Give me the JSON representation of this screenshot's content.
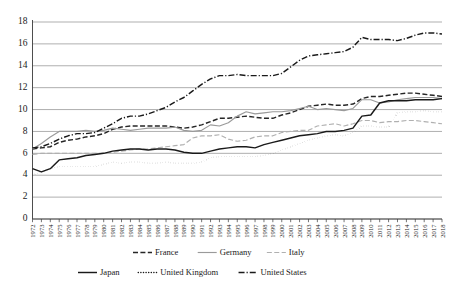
{
  "chart_data": {
    "type": "line",
    "title": "",
    "xlabel": "",
    "ylabel": "",
    "ylim": [
      0,
      18
    ],
    "ytick_step": 2,
    "yticks": [
      "0",
      "2",
      "4",
      "6",
      "8",
      "10",
      "12",
      "14",
      "16",
      "18"
    ],
    "grid": true,
    "legend_position": "bottom",
    "x": [
      1972,
      1973,
      1974,
      1975,
      1976,
      1977,
      1978,
      1979,
      1980,
      1981,
      1982,
      1983,
      1984,
      1985,
      1986,
      1987,
      1988,
      1989,
      1990,
      1991,
      1992,
      1993,
      1994,
      1995,
      1996,
      1997,
      1998,
      1999,
      2000,
      2001,
      2002,
      2003,
      2004,
      2005,
      2006,
      2007,
      2008,
      2009,
      2010,
      2011,
      2012,
      2013,
      2014,
      2015,
      2016,
      2017,
      2018
    ],
    "categories": [
      "1972",
      "1973",
      "1974",
      "1975",
      "1976",
      "1977",
      "1978",
      "1979",
      "1980",
      "1981",
      "1982",
      "1983",
      "1984",
      "1985",
      "1986",
      "1987",
      "1988",
      "1989",
      "1990",
      "1991",
      "1992",
      "1993",
      "1994",
      "1995",
      "1996",
      "1997",
      "1998",
      "1999",
      "2000",
      "2001",
      "2002",
      "2003",
      "2004",
      "2005",
      "2006",
      "2007",
      "2008",
      "2009",
      "2010",
      "2011",
      "2012",
      "2013",
      "2014",
      "2015",
      "2016",
      "2017",
      "2018"
    ],
    "series": [
      {
        "name": "France",
        "color": "#262626",
        "dash": "dashed",
        "values": [
          6.4,
          6.5,
          6.6,
          7.0,
          7.2,
          7.3,
          7.5,
          7.6,
          7.8,
          8.2,
          8.4,
          8.5,
          8.5,
          8.5,
          8.5,
          8.5,
          8.4,
          8.3,
          8.4,
          8.6,
          8.9,
          9.2,
          9.2,
          9.3,
          9.4,
          9.3,
          9.2,
          9.2,
          9.5,
          9.7,
          10.0,
          10.3,
          10.4,
          10.5,
          10.4,
          10.4,
          10.5,
          11.0,
          11.2,
          11.2,
          11.3,
          11.4,
          11.5,
          11.5,
          11.4,
          11.3,
          11.2
        ]
      },
      {
        "name": "Germany",
        "color": "#9a9a9a",
        "dash": "solid",
        "values": [
          6.4,
          6.9,
          7.5,
          8.0,
          8.0,
          8.0,
          8.1,
          8.0,
          8.1,
          8.3,
          8.2,
          8.1,
          8.2,
          8.3,
          8.3,
          8.3,
          8.4,
          8.1,
          8.0,
          8.1,
          8.6,
          8.5,
          8.8,
          9.4,
          9.8,
          9.6,
          9.7,
          9.8,
          9.8,
          9.9,
          10.1,
          10.3,
          10.0,
          10.1,
          10.0,
          9.9,
          10.1,
          10.9,
          10.9,
          10.6,
          10.7,
          10.9,
          11.0,
          11.1,
          11.1,
          11.1,
          11.0
        ]
      },
      {
        "name": "Italy",
        "color": "#b0b0b0",
        "dash": "dashed",
        "values": [
          5.9,
          6.0,
          6.0,
          6.0,
          6.0,
          6.0,
          6.0,
          6.0,
          6.0,
          6.1,
          6.2,
          6.3,
          6.4,
          6.4,
          6.5,
          6.6,
          6.7,
          6.8,
          7.4,
          7.6,
          7.6,
          7.7,
          7.3,
          7.1,
          7.2,
          7.5,
          7.6,
          7.6,
          7.9,
          8.0,
          8.1,
          8.1,
          8.5,
          8.6,
          8.7,
          8.5,
          8.7,
          9.0,
          9.0,
          8.8,
          8.9,
          8.9,
          9.0,
          9.0,
          8.9,
          8.8,
          8.7
        ]
      },
      {
        "name": "Japan",
        "color": "#1a1a1a",
        "dash": "solid",
        "values": [
          4.6,
          4.3,
          4.6,
          5.4,
          5.5,
          5.6,
          5.8,
          5.9,
          6.0,
          6.2,
          6.3,
          6.4,
          6.4,
          6.3,
          6.4,
          6.4,
          6.3,
          6.1,
          6.0,
          6.0,
          6.2,
          6.4,
          6.5,
          6.6,
          6.6,
          6.5,
          6.8,
          7.0,
          7.2,
          7.4,
          7.6,
          7.7,
          7.8,
          8.0,
          8.0,
          8.1,
          8.3,
          9.4,
          9.5,
          10.6,
          10.8,
          10.8,
          10.8,
          10.9,
          10.9,
          10.9,
          11.0
        ]
      },
      {
        "name": "United Kingdom",
        "color": "#1a1a1a",
        "dash": "dotted",
        "values": [
          4.0,
          4.3,
          4.6,
          4.8,
          4.8,
          4.8,
          4.8,
          4.8,
          5.0,
          5.2,
          5.1,
          5.2,
          5.2,
          5.1,
          5.1,
          5.2,
          5.1,
          5.1,
          5.1,
          5.2,
          5.6,
          5.7,
          5.7,
          5.7,
          5.7,
          5.7,
          5.8,
          6.0,
          6.3,
          6.6,
          6.9,
          7.2,
          7.4,
          7.6,
          7.7,
          7.6,
          7.9,
          8.5,
          8.5,
          8.4,
          8.4,
          9.7,
          9.8,
          9.8,
          9.9,
          9.8,
          9.8
        ]
      },
      {
        "name": "United States",
        "color": "#1a1a1a",
        "dash": "dashdot",
        "values": [
          6.5,
          6.6,
          6.9,
          7.3,
          7.6,
          7.8,
          7.8,
          7.9,
          8.3,
          8.7,
          9.2,
          9.4,
          9.4,
          9.6,
          9.9,
          10.2,
          10.7,
          11.1,
          11.7,
          12.3,
          12.8,
          13.1,
          13.1,
          13.2,
          13.1,
          13.1,
          13.1,
          13.1,
          13.3,
          13.9,
          14.5,
          14.9,
          15.0,
          15.1,
          15.2,
          15.3,
          15.7,
          16.6,
          16.4,
          16.4,
          16.4,
          16.3,
          16.5,
          16.8,
          17.0,
          17.0,
          16.9
        ]
      }
    ],
    "legend_rows": [
      [
        {
          "label": "France",
          "dash": "dashed",
          "color": "#262626"
        },
        {
          "label": "Germany",
          "dash": "solid",
          "color": "#9a9a9a"
        },
        {
          "label": "Italy",
          "dash": "dashed",
          "color": "#b0b0b0"
        }
      ],
      [
        {
          "label": "Japan",
          "dash": "solid",
          "color": "#1a1a1a"
        },
        {
          "label": "United Kingdom",
          "dash": "dotted",
          "color": "#1a1a1a"
        },
        {
          "label": "United States",
          "dash": "dashdot",
          "color": "#1a1a1a"
        }
      ]
    ]
  }
}
